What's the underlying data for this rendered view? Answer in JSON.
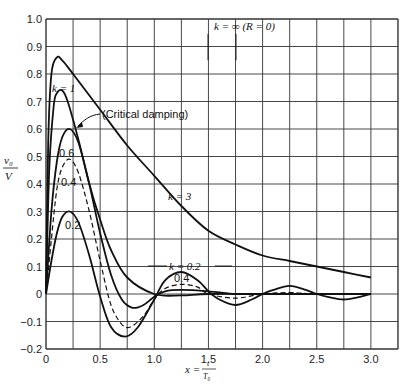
{
  "chart_data": {
    "type": "line",
    "title": "",
    "xlabel": "x = t / T0",
    "ylabel": "v0 / V",
    "xlim": [
      0,
      3.25
    ],
    "ylim": [
      -0.2,
      1.0
    ],
    "grid": true,
    "x_ticks": [
      "0",
      "0.5",
      "1.0",
      "1.5",
      "2.0",
      "2.5",
      "3.0"
    ],
    "x_tick_values": [
      0,
      0.5,
      1.0,
      1.5,
      2.0,
      2.5,
      3.0
    ],
    "y_ticks": [
      "1.0",
      "0.9",
      "0.8",
      "0.7",
      "0.6",
      "0.5",
      "0.4",
      "0.3",
      "0.2",
      "0.1",
      "0",
      "−0.1",
      "−0.2"
    ],
    "y_tick_values": [
      1.0,
      0.9,
      0.8,
      0.7,
      0.6,
      0.5,
      0.4,
      0.3,
      0.2,
      0.1,
      0,
      -0.1,
      -0.2
    ],
    "series": [
      {
        "name": "k = 3",
        "style": "solid",
        "x": [
          0,
          0.02,
          0.05,
          0.1,
          0.15,
          0.25,
          0.5,
          0.75,
          1.0,
          1.25,
          1.5,
          1.75,
          2.0,
          2.25,
          2.5,
          2.75,
          3.0
        ],
        "y": [
          0,
          0.55,
          0.8,
          0.86,
          0.85,
          0.8,
          0.67,
          0.54,
          0.43,
          0.32,
          0.23,
          0.18,
          0.14,
          0.12,
          0.1,
          0.08,
          0.06
        ]
      },
      {
        "name": "k = 1 (Critical damping)",
        "style": "solid",
        "x": [
          0,
          0.03,
          0.07,
          0.1,
          0.15,
          0.2,
          0.3,
          0.4,
          0.5,
          0.6,
          0.75,
          1.0,
          1.25,
          1.5,
          2.0,
          2.5,
          3.0
        ],
        "y": [
          0,
          0.45,
          0.68,
          0.73,
          0.74,
          0.7,
          0.56,
          0.4,
          0.27,
          0.16,
          0.06,
          0.0,
          -0.005,
          0.0,
          0.0,
          0.0,
          0.0
        ]
      },
      {
        "name": "k = 0.6",
        "style": "solid",
        "x": [
          0,
          0.05,
          0.1,
          0.15,
          0.22,
          0.3,
          0.4,
          0.5,
          0.6,
          0.7,
          0.8,
          0.9,
          1.0,
          1.1,
          1.25,
          1.5,
          1.75,
          2.0,
          2.5,
          3.0
        ],
        "y": [
          0,
          0.3,
          0.48,
          0.57,
          0.6,
          0.55,
          0.4,
          0.22,
          0.07,
          -0.02,
          -0.05,
          -0.04,
          -0.01,
          0.01,
          0.015,
          0.01,
          0.0,
          0.0,
          0.0,
          0.0
        ]
      },
      {
        "name": "k = 0.4",
        "style": "dashed",
        "x": [
          0,
          0.05,
          0.1,
          0.15,
          0.22,
          0.3,
          0.4,
          0.5,
          0.6,
          0.7,
          0.78,
          0.9,
          1.0,
          1.1,
          1.25,
          1.4,
          1.5,
          1.75,
          2.0,
          2.25,
          2.5,
          3.0
        ],
        "y": [
          0,
          0.2,
          0.38,
          0.46,
          0.49,
          0.44,
          0.3,
          0.12,
          -0.04,
          -0.11,
          -0.12,
          -0.08,
          -0.02,
          0.02,
          0.035,
          0.025,
          0.0,
          -0.015,
          0.0,
          0.005,
          0.0,
          0.0
        ]
      },
      {
        "name": "k = 0.2",
        "style": "solid",
        "x": [
          0,
          0.05,
          0.1,
          0.15,
          0.22,
          0.3,
          0.4,
          0.5,
          0.6,
          0.73,
          0.85,
          1.0,
          1.1,
          1.25,
          1.4,
          1.5,
          1.6,
          1.75,
          1.9,
          2.0,
          2.1,
          2.25,
          2.4,
          2.5,
          2.6,
          2.75,
          2.9,
          3.0
        ],
        "y": [
          0,
          0.12,
          0.22,
          0.28,
          0.3,
          0.26,
          0.14,
          -0.01,
          -0.12,
          -0.155,
          -0.12,
          -0.02,
          0.05,
          0.08,
          0.05,
          0.01,
          -0.02,
          -0.04,
          -0.02,
          0.0,
          0.015,
          0.03,
          0.015,
          0.0,
          -0.01,
          -0.02,
          -0.01,
          0.0
        ]
      },
      {
        "name": "k = ∞ (R = 0)",
        "style": "vertical-lines",
        "x": [],
        "y": []
      }
    ],
    "annotations": [
      {
        "text": "k = ∞ (R = 0)",
        "x": 1.7,
        "y": 0.97
      },
      {
        "text": "k = 1",
        "x": 0.16,
        "y": 0.78
      },
      {
        "text": "(Critical damping)",
        "x": 0.55,
        "y": 0.7
      },
      {
        "text": "k = 3",
        "x": 1.32,
        "y": 0.4
      },
      {
        "text": "0.6",
        "x": 0.17,
        "y": 0.51
      },
      {
        "text": "0.4",
        "x": 0.17,
        "y": 0.41
      },
      {
        "text": "0.2",
        "x": 0.24,
        "y": 0.24
      },
      {
        "text": "k = 0.2",
        "x": 1.3,
        "y": 0.1
      },
      {
        "text": "0.4",
        "x": 1.3,
        "y": 0.045
      }
    ],
    "legend_position": "none"
  },
  "labels": {
    "k_inf": "k = ∞ (R = 0)",
    "k1": "k = 1",
    "critical": "(Critical damping)",
    "k3": "k = 3",
    "k06": "0.6",
    "k04": "0.4",
    "k02": "0.2",
    "k02b": "k = 0.2",
    "k04b": "0.4",
    "xlabel_left": "x = ",
    "xlabel_num": "t",
    "xlabel_den": "T₀",
    "ylabel_num": "v₀",
    "ylabel_den": "V"
  }
}
